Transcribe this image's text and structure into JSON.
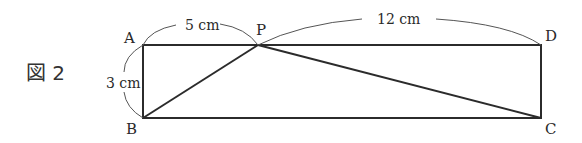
{
  "figure": {
    "label": "図 2",
    "shape": "rectangle ABCD with point P on side AD; segments BP and PC drawn",
    "vertices": {
      "A": "A",
      "B": "B",
      "C": "C",
      "D": "D",
      "P": "P"
    },
    "measurements": {
      "AP": "5 cm",
      "PD": "12 cm",
      "AB": "3 cm"
    },
    "colors": {
      "stroke": "#2b2b2b",
      "arc": "#555555",
      "background": "#ffffff"
    }
  }
}
